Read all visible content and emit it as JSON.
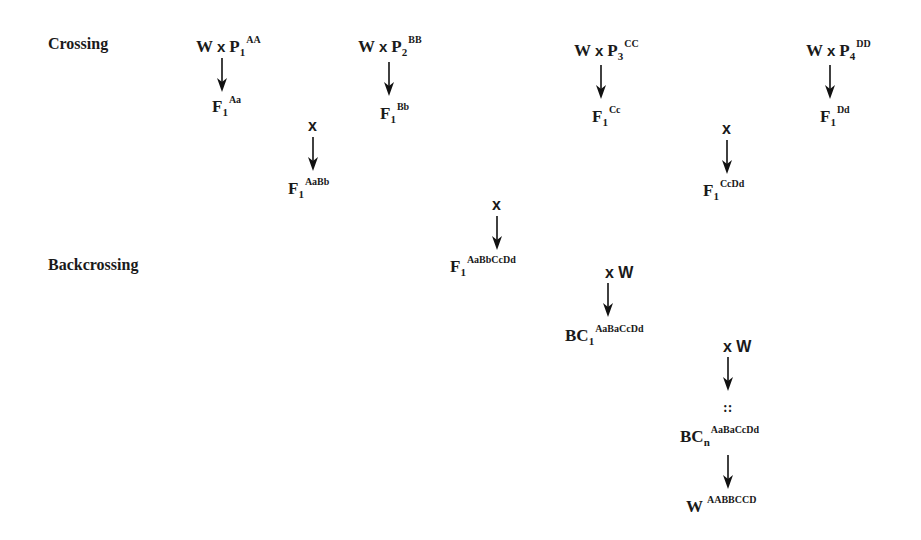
{
  "sections": {
    "crossing_label": "Crossing",
    "backcrossing_label": "Backcrossing"
  },
  "crosses": [
    {
      "left": "W",
      "op": "x",
      "parent": "P",
      "parent_sub": "1",
      "parent_sup": "AA",
      "result": "F",
      "result_sub": "1",
      "result_sup": "Aa"
    },
    {
      "left": "W",
      "op": "x",
      "parent": "P",
      "parent_sub": "2",
      "parent_sup": "BB",
      "result": "F",
      "result_sub": "1",
      "result_sup": "Bb"
    },
    {
      "left": "W",
      "op": "x",
      "parent": "P",
      "parent_sub": "3",
      "parent_sup": "CC",
      "result": "F",
      "result_sub": "1",
      "result_sup": "Cc"
    },
    {
      "left": "W",
      "op": "x",
      "parent": "P",
      "parent_sub": "4",
      "parent_sup": "DD",
      "result": "F",
      "result_sub": "1",
      "result_sup": "Dd"
    }
  ],
  "intercrosses": [
    {
      "op": "x",
      "result": "F",
      "result_sub": "1",
      "result_sup": "AaBb"
    },
    {
      "op": "x",
      "result": "F",
      "result_sub": "1",
      "result_sup": "CcDd"
    },
    {
      "op": "x",
      "result": "F",
      "result_sub": "1",
      "result_sup": "AaBbCcDd"
    }
  ],
  "backcrosses": [
    {
      "op": "x W",
      "result": "BC",
      "result_sub": "1",
      "result_sup": "AaBaCcDd"
    },
    {
      "op": "x W",
      "continuation": "::",
      "result": "BC",
      "result_sub": "n",
      "result_sup": "AaBaCcDd"
    }
  ],
  "final": {
    "name": "W",
    "sup": "AABBCCD"
  }
}
